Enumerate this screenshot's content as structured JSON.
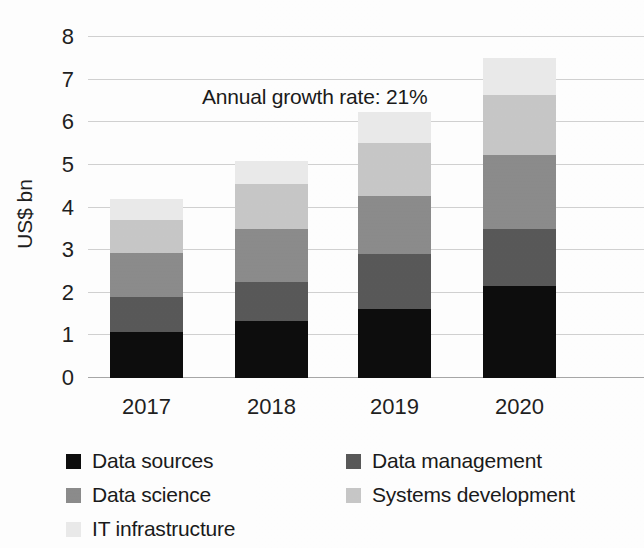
{
  "chart_data": {
    "type": "bar",
    "stacked": true,
    "title": "",
    "xlabel": "",
    "ylabel": "US$ bn",
    "categories": [
      "2017",
      "2018",
      "2019",
      "2020"
    ],
    "ylim": [
      0,
      8
    ],
    "yticks": [
      0,
      1,
      2,
      3,
      4,
      5,
      6,
      7,
      8
    ],
    "ytick_labels": [
      "0",
      "1",
      "2",
      "3",
      "4",
      "5",
      "6",
      "7",
      "8"
    ],
    "grid": true,
    "legend_position": "bottom",
    "series": [
      {
        "name": "Data sources",
        "color": "#0d0d0d",
        "values": [
          1.08,
          1.33,
          1.62,
          2.17
        ]
      },
      {
        "name": "Data management",
        "color": "#595959",
        "values": [
          0.82,
          0.92,
          1.28,
          1.33
        ]
      },
      {
        "name": "Data science",
        "color": "#8c8c8c",
        "values": [
          1.03,
          1.25,
          1.36,
          1.74
        ]
      },
      {
        "name": "Systems development",
        "color": "#c8c8c8",
        "values": [
          0.78,
          1.05,
          1.26,
          1.41
        ]
      },
      {
        "name": "IT infrastructure",
        "color": "#ebebeb",
        "values": [
          0.49,
          0.55,
          0.72,
          0.85
        ]
      }
    ],
    "totals": [
      4.2,
      5.1,
      6.24,
      7.5
    ],
    "annotations": [
      {
        "text": "Annual growth rate: 21%",
        "x": "between 2017 and 2018",
        "y": 7.3
      }
    ]
  },
  "legend": {
    "rows": [
      [
        {
          "label": "Data sources",
          "color": "#0d0d0d"
        },
        {
          "label": "Data management",
          "color": "#595959"
        }
      ],
      [
        {
          "label": "Data science",
          "color": "#8c8c8c"
        },
        {
          "label": "Systems development",
          "color": "#c8c8c8"
        }
      ],
      [
        {
          "label": "IT infrastructure",
          "color": "#ebebeb"
        }
      ]
    ]
  }
}
